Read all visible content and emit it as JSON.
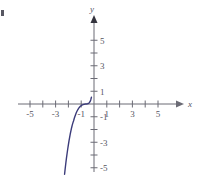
{
  "figure": {
    "title": "",
    "background_color": "#ffffff",
    "axis_color": "#6b6b75",
    "curve_color": "#3b3b7a",
    "label_color": "#55555f",
    "x_axis_label": "x",
    "y_axis_label": "y",
    "corner_mark": "edge-artifact"
  },
  "chart_data": {
    "type": "line",
    "title": "",
    "xlabel": "x",
    "ylabel": "y",
    "xlim": [
      -6,
      6
    ],
    "ylim": [
      -6,
      6
    ],
    "grid": false,
    "legend": null,
    "x_ticks": [
      -5,
      -4,
      -3,
      -2,
      -1,
      1,
      2,
      3,
      4,
      5
    ],
    "x_tick_labels": [
      "-5",
      "",
      "-3",
      "",
      "-1",
      "1",
      "",
      "3",
      "",
      "5"
    ],
    "y_ticks": [
      -5,
      -4,
      -3,
      -2,
      -1,
      1,
      2,
      3,
      4,
      5
    ],
    "y_tick_labels": [
      "-5",
      "",
      "-3",
      "",
      "-1",
      "1",
      "",
      "3",
      "",
      "5"
    ],
    "x_axis_arrow": "right",
    "y_axis_arrow": "up",
    "series": [
      {
        "name": "cubic",
        "equation": "y = (x + 1.5)^3",
        "color": "#3b3b7a",
        "x": [
          -2.3,
          -2.25,
          -2.2,
          -2.15,
          -2.1,
          -2.05,
          -2.0,
          -1.95,
          -1.9,
          -1.85,
          -1.8,
          -1.75,
          -1.7,
          -1.65,
          -1.6,
          -1.55,
          -1.5,
          -1.45,
          -1.4,
          -1.35,
          -1.3,
          -1.25,
          -1.2,
          -1.15,
          -1.1,
          -1.05,
          -1.0,
          -0.95,
          -0.9,
          -0.85,
          -0.8,
          -0.75,
          -0.7,
          -0.65,
          -0.6,
          -0.55,
          -0.5,
          -0.45,
          -0.4,
          -0.35,
          -0.3,
          -0.25,
          -0.2
        ],
        "y": [
          -5.51,
          -5.06,
          -4.63,
          -4.23,
          -3.86,
          -3.51,
          -3.18,
          -2.87,
          -2.59,
          -2.33,
          -2.09,
          -1.86,
          -1.66,
          -1.48,
          -1.33,
          -1.16,
          -1.0,
          -0.86,
          -0.73,
          -0.61,
          -0.51,
          -0.42,
          -0.34,
          -0.27,
          -0.21,
          -0.16,
          -0.13,
          -0.09,
          -0.07,
          -0.05,
          -0.03,
          -0.02,
          -0.01,
          -0.0,
          0.0,
          0.01,
          0.02,
          0.04,
          0.07,
          0.12,
          0.2,
          0.34,
          0.53
        ]
      }
    ],
    "annotations": []
  }
}
